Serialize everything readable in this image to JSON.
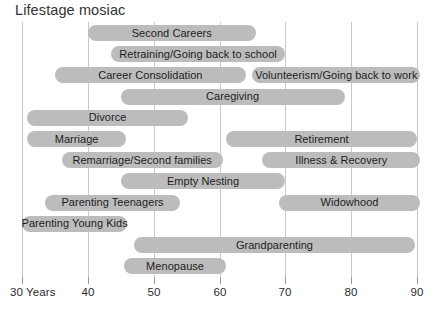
{
  "chart_data": {
    "type": "bar",
    "orientation": "horizontal",
    "title": "Lifestage mosiac",
    "xlabel": "",
    "ylabel": "",
    "xlim": [
      30,
      90
    ],
    "grid": true,
    "legend": null,
    "bar_color": "#bcbcbc",
    "gridline_color": "#c9c9c9",
    "axis_tick_labels": [
      "30 Years",
      "40",
      "50",
      "60",
      "70",
      "80",
      "90"
    ],
    "axis_tick_values": [
      30,
      40,
      50,
      60,
      70,
      80,
      90
    ],
    "categories": [
      "Second Careers",
      "Retraining/Going back to school",
      "Career Consolidation",
      "Volunteerism/Going back to work",
      "Caregiving",
      "Divorce",
      "Marriage",
      "Retirement",
      "Remarriage/Second families",
      "Illness & Recovery",
      "Empty Nesting",
      "Parenting Teenagers",
      "Widowhood",
      "Parenting Young Kids",
      "Grandparenting",
      "Menopause"
    ],
    "bars": [
      {
        "label": "Second Careers",
        "row": 0,
        "start": 40.0,
        "end": 65.5
      },
      {
        "label": "Retraining/Going back to school",
        "row": 1,
        "start": 43.5,
        "end": 70.0
      },
      {
        "label": "Career Consolidation",
        "row": 2,
        "start": 35.0,
        "end": 64.0
      },
      {
        "label": "Volunteerism/Going back to work",
        "row": 2,
        "start": 65.0,
        "end": 90.5
      },
      {
        "label": "Caregiving",
        "row": 3,
        "start": 45.0,
        "end": 79.0
      },
      {
        "label": "Divorce",
        "row": 4,
        "start": 30.8,
        "end": 55.2
      },
      {
        "label": "Marriage",
        "row": 5,
        "start": 30.8,
        "end": 45.8
      },
      {
        "label": "Retirement",
        "row": 5,
        "start": 61.0,
        "end": 90.0
      },
      {
        "label": "Remarriage/Second families",
        "row": 6,
        "start": 36.0,
        "end": 60.5
      },
      {
        "label": "Illness & Recovery",
        "row": 6,
        "start": 66.5,
        "end": 90.5
      },
      {
        "label": "Empty Nesting",
        "row": 7,
        "start": 45.0,
        "end": 70.0
      },
      {
        "label": "Parenting Teenagers",
        "row": 8,
        "start": 33.5,
        "end": 54.0
      },
      {
        "label": "Widowhood",
        "row": 8,
        "start": 69.0,
        "end": 90.5
      },
      {
        "label": "Parenting Young Kids",
        "row": 9,
        "start": 30.0,
        "end": 46.0
      },
      {
        "label": "Grandparenting",
        "row": 10,
        "start": 47.0,
        "end": 89.7
      },
      {
        "label": "Menopause",
        "row": 11,
        "start": 45.5,
        "end": 61.0
      }
    ]
  }
}
